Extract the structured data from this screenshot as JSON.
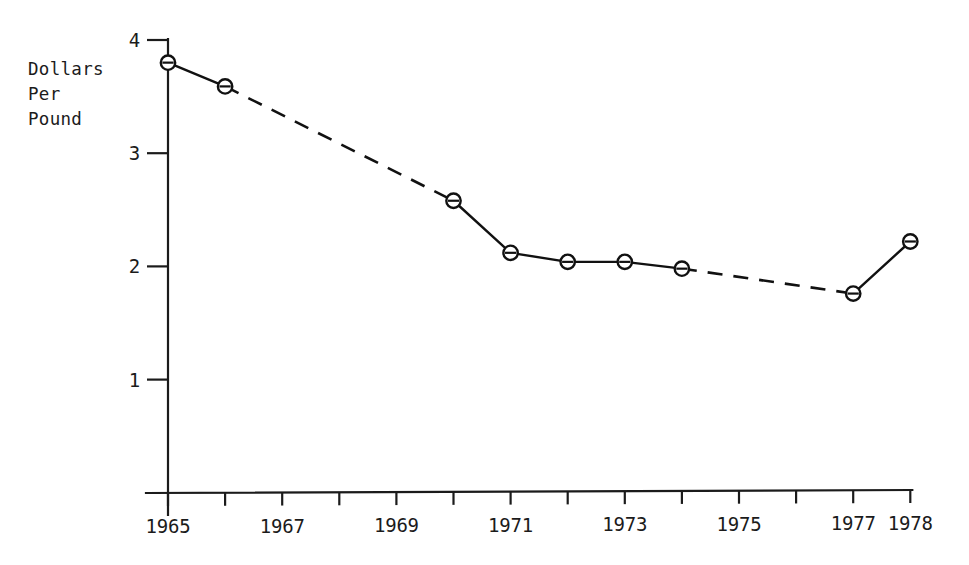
{
  "chart_data": {
    "type": "line",
    "title": "",
    "subtitle": "",
    "xlabel": "",
    "ylabel": "Dollars\nPer\nPound",
    "ylabel_lines": [
      "Dollars",
      "Per",
      "Pound"
    ],
    "x": [
      1965,
      1966,
      1970,
      1971,
      1972,
      1973,
      1974,
      1977,
      1978
    ],
    "values": [
      3.8,
      3.59,
      2.58,
      2.12,
      2.04,
      2.04,
      1.98,
      1.76,
      2.22
    ],
    "series": [
      {
        "name": "Dollars Per Pound",
        "points": [
          {
            "x": 1965,
            "y": 3.8
          },
          {
            "x": 1966,
            "y": 3.59
          },
          {
            "x": 1970,
            "y": 2.58
          },
          {
            "x": 1971,
            "y": 2.12
          },
          {
            "x": 1972,
            "y": 2.04
          },
          {
            "x": 1973,
            "y": 2.04
          },
          {
            "x": 1974,
            "y": 1.98
          },
          {
            "x": 1977,
            "y": 1.76
          },
          {
            "x": 1978,
            "y": 2.22
          }
        ],
        "dashed_segments": [
          [
            1966,
            1970
          ],
          [
            1974,
            1977
          ]
        ],
        "solid_segments": [
          [
            1965,
            1966
          ],
          [
            1970,
            1971
          ],
          [
            1971,
            1972
          ],
          [
            1972,
            1973
          ],
          [
            1973,
            1974
          ],
          [
            1977,
            1978
          ]
        ],
        "marker": "circle-with-horizontal-bar",
        "color": "#111111"
      }
    ],
    "xlim": [
      1965,
      1978
    ],
    "ylim": [
      0,
      4
    ],
    "yticks": [
      1,
      2,
      3,
      4
    ],
    "ytick_labels": [
      "1",
      "2",
      "3",
      "4"
    ],
    "xticks": [
      1965,
      1966,
      1967,
      1968,
      1969,
      1970,
      1971,
      1972,
      1973,
      1974,
      1975,
      1976,
      1977,
      1978
    ],
    "xtick_labels_shown": [
      "1965",
      "1967",
      "1969",
      "1971",
      "1973",
      "1975",
      "1977",
      "1978"
    ],
    "grid": false,
    "legend": "none",
    "axis_color": "#1b1b1b"
  }
}
